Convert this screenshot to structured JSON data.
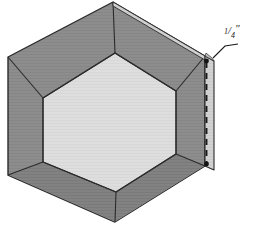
{
  "figure": {
    "kind": "technical-illustration",
    "title": ""
  },
  "annotations": [
    {
      "id": "seam-allowance",
      "text": "1/4\"",
      "numerator": "1",
      "denominator": "4",
      "unit": "\"",
      "points_to": "right-vertical-edge"
    }
  ],
  "colors": {
    "background": "#ffffff",
    "border_band": "#8d8d8d",
    "border_band_shaded": "#7e7e7e",
    "center_panel": "#dedede",
    "edge_strip": "#cfcfcf",
    "outline": "#2b2b2b",
    "stitch_line": "#1a1a1a",
    "label_text": "#1a1a1a"
  },
  "geometry": {
    "outer_hexagon": "113,2 205,56 205,166 115,222 8,175 8,57",
    "inner_hexagon": "115,53 176,91 176,154 116,192 43,162 43,98",
    "top_seam_left": "8,57 113,2",
    "top_seam_right": "113,2 205,56",
    "right_edge_x": 205,
    "stitch_line_x": 207,
    "stitch_top_y": 60,
    "stitch_bottom_y": 163
  },
  "elements": {
    "center_panel_name": "center-hexagon-panel",
    "border_band_name": "hexagon-border-band",
    "seam_edge_name": "seam-allowance-edge",
    "stitch_line_name": "stitching-dashed-line"
  }
}
